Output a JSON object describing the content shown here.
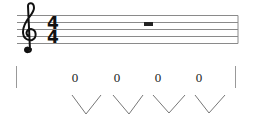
{
  "staff": {
    "clef": "treble-clef",
    "time_signature": {
      "numerator": "4",
      "denominator": "4"
    },
    "rest": "whole-rest",
    "line_color": "#8a8a8a"
  },
  "tab": {
    "values": [
      "0",
      "0",
      "0",
      "0"
    ],
    "stroke_color": "#777777"
  }
}
